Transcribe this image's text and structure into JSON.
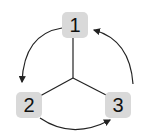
{
  "diagram": {
    "type": "cycle",
    "nodes": [
      {
        "id": "1",
        "label": "1"
      },
      {
        "id": "2",
        "label": "2"
      },
      {
        "id": "3",
        "label": "3"
      }
    ],
    "edges": [
      {
        "from": "1",
        "to": "2",
        "style": "curved-arrow"
      },
      {
        "from": "2",
        "to": "3",
        "style": "curved-arrow"
      },
      {
        "from": "3",
        "to": "1",
        "style": "curved-arrow"
      }
    ],
    "center_connector": "Y-junction linking nodes 1, 2, 3",
    "colors": {
      "node_fill": "#d9d9d9",
      "line": "#222222"
    }
  }
}
